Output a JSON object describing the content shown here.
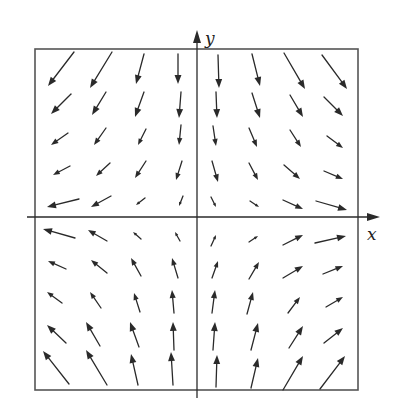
{
  "figure": {
    "type": "vector_field",
    "x_axis_label": "x",
    "y_axis_label": "y",
    "colors": {
      "ink": "#2a2a2a",
      "frame": "#555555",
      "background": "#ffffff"
    }
  },
  "chart_data": {
    "type": "vector_field",
    "title": "",
    "xlabel": "x",
    "ylabel": "y",
    "grid": false,
    "frame": {
      "x1": 35,
      "y1": 49,
      "x2": 358,
      "y2": 390
    },
    "x_axis": {
      "y": 217,
      "x_start": 27,
      "x_end": 380
    },
    "y_axis": {
      "x": 197,
      "y_start": 398,
      "y_end": 30
    },
    "arrows": [
      [
        74,
        52,
        48,
        86
      ],
      [
        112,
        52,
        90,
        88
      ],
      [
        144,
        54,
        136,
        84
      ],
      [
        178,
        54,
        178,
        84
      ],
      [
        218,
        55,
        219,
        88
      ],
      [
        252,
        54,
        260,
        86
      ],
      [
        284,
        53,
        305,
        89
      ],
      [
        322,
        55,
        347,
        89
      ],
      [
        71,
        94,
        51,
        114
      ],
      [
        106,
        92,
        92,
        115
      ],
      [
        144,
        92,
        135,
        117
      ],
      [
        181,
        92,
        179,
        118
      ],
      [
        216,
        92,
        217,
        118
      ],
      [
        252,
        93,
        260,
        118
      ],
      [
        290,
        95,
        303,
        117
      ],
      [
        324,
        97,
        343,
        116
      ],
      [
        68,
        133,
        51,
        145
      ],
      [
        106,
        128,
        94,
        145
      ],
      [
        146,
        129,
        138,
        145
      ],
      [
        181,
        125,
        179,
        145
      ],
      [
        213,
        126,
        216,
        146
      ],
      [
        249,
        128,
        257,
        147
      ],
      [
        290,
        130,
        301,
        147
      ],
      [
        327,
        136,
        343,
        148
      ],
      [
        70,
        166,
        53,
        175
      ],
      [
        110,
        163,
        96,
        176
      ],
      [
        146,
        161,
        135,
        178
      ],
      [
        182,
        161,
        176,
        180
      ],
      [
        212,
        161,
        218,
        182
      ],
      [
        249,
        163,
        258,
        180
      ],
      [
        284,
        165,
        300,
        179
      ],
      [
        324,
        171,
        343,
        179
      ],
      [
        79,
        199,
        47,
        207
      ],
      [
        111,
        196,
        91,
        207
      ],
      [
        145,
        198,
        136,
        205
      ],
      [
        183,
        196,
        179,
        206
      ],
      [
        211,
        197,
        216,
        207
      ],
      [
        250,
        201,
        259,
        207
      ],
      [
        283,
        200,
        303,
        209
      ],
      [
        316,
        201,
        347,
        210
      ],
      [
        75,
        238,
        43,
        229
      ],
      [
        107,
        241,
        88,
        230
      ],
      [
        141,
        239,
        133,
        232
      ],
      [
        180,
        241,
        175,
        232
      ],
      [
        211,
        246,
        216,
        235
      ],
      [
        249,
        242,
        258,
        236
      ],
      [
        283,
        245,
        303,
        235
      ],
      [
        315,
        243,
        346,
        236
      ],
      [
        66,
        269,
        48,
        261
      ],
      [
        107,
        273,
        91,
        260
      ],
      [
        141,
        276,
        131,
        258
      ],
      [
        178,
        278,
        172,
        258
      ],
      [
        212,
        278,
        218,
        261
      ],
      [
        249,
        279,
        259,
        262
      ],
      [
        283,
        278,
        303,
        266
      ],
      [
        323,
        274,
        343,
        266
      ],
      [
        62,
        303,
        47,
        292
      ],
      [
        101,
        308,
        90,
        292
      ],
      [
        140,
        312,
        134,
        293
      ],
      [
        174,
        313,
        172,
        290
      ],
      [
        212,
        313,
        215,
        290
      ],
      [
        247,
        314,
        253,
        292
      ],
      [
        288,
        313,
        300,
        297
      ],
      [
        326,
        307,
        343,
        297
      ],
      [
        66,
        343,
        47,
        325
      ],
      [
        100,
        346,
        86,
        322
      ],
      [
        139,
        347,
        130,
        322
      ],
      [
        174,
        350,
        173,
        322
      ],
      [
        213,
        350,
        215,
        322
      ],
      [
        251,
        350,
        258,
        323
      ],
      [
        289,
        348,
        303,
        326
      ],
      [
        324,
        343,
        343,
        328
      ],
      [
        69,
        384,
        43,
        351
      ],
      [
        107,
        385,
        86,
        350
      ],
      [
        138,
        385,
        131,
        354
      ],
      [
        173,
        385,
        171,
        352
      ],
      [
        216,
        387,
        217,
        355
      ],
      [
        251,
        388,
        258,
        358
      ],
      [
        283,
        390,
        303,
        356
      ],
      [
        320,
        389,
        345,
        356
      ]
    ]
  }
}
